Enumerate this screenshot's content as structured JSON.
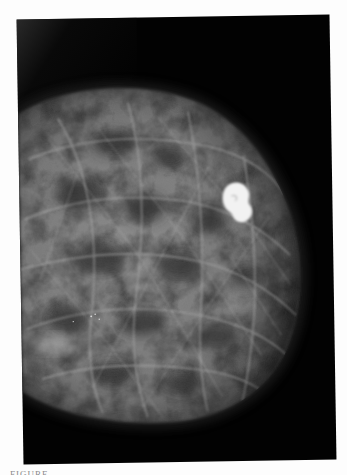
{
  "figure": {
    "type": "mammogram",
    "background_color": "#020202",
    "tissue_color": "#8c8c8c",
    "lesion_color": "#f2f2f2",
    "page_color": "#fdfdfd"
  },
  "caption": {
    "text": "FIGURE"
  }
}
